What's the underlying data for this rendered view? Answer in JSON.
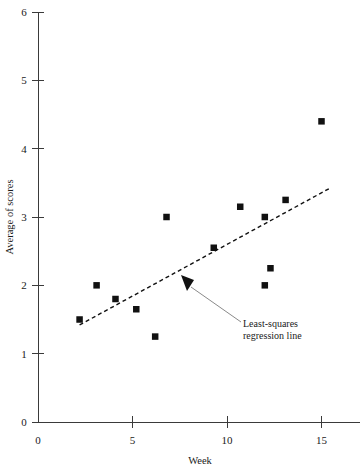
{
  "chart_data": {
    "type": "scatter",
    "title": "",
    "xlabel": "Week",
    "ylabel": "Average of scores",
    "xlim": [
      0,
      17
    ],
    "ylim": [
      0,
      6
    ],
    "xticks": [
      0,
      5,
      10,
      15
    ],
    "xtick_labels": [
      "0",
      "5",
      "10",
      "15"
    ],
    "yticks": [
      0,
      1,
      2,
      3,
      4,
      5,
      6
    ],
    "ytick_labels": [
      "0",
      "1",
      "2",
      "3",
      "4",
      "5",
      "6"
    ],
    "grid": false,
    "legend": null,
    "points": [
      {
        "x": 2.2,
        "y": 1.5
      },
      {
        "x": 3.1,
        "y": 2.0
      },
      {
        "x": 4.1,
        "y": 1.8
      },
      {
        "x": 5.2,
        "y": 1.65
      },
      {
        "x": 6.2,
        "y": 1.25
      },
      {
        "x": 6.8,
        "y": 3.0
      },
      {
        "x": 9.3,
        "y": 2.55
      },
      {
        "x": 10.7,
        "y": 3.15
      },
      {
        "x": 12.0,
        "y": 2.0
      },
      {
        "x": 12.0,
        "y": 3.0
      },
      {
        "x": 12.3,
        "y": 2.25
      },
      {
        "x": 13.1,
        "y": 3.25
      },
      {
        "x": 15.0,
        "y": 4.4
      }
    ],
    "regression_line": {
      "label": "Least-squares regression line",
      "style": "dashed",
      "x_start": 2.2,
      "y_start": 1.42,
      "x_end": 15.5,
      "y_end": 3.43
    },
    "annotations": [
      {
        "text_line1": "Least-squares",
        "text_line2": "regression line",
        "target_x": 7.7,
        "target_y": 2.1,
        "text_x": 10.7,
        "text_y": 1.45
      }
    ]
  },
  "axes": {
    "x_axis_title": "Week",
    "y_axis_title": "Average of scores"
  },
  "annotation": {
    "line1": "Least-squares",
    "line2": "regression line"
  }
}
